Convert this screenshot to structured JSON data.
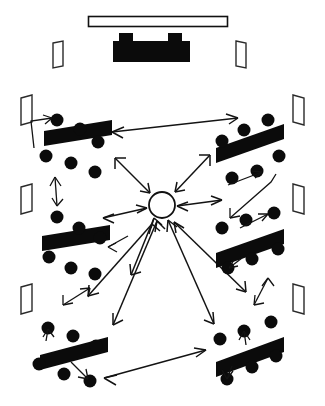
{
  "diagram": {
    "type": "floor-plan-interaction-diagram",
    "canvas": {
      "width": 325,
      "height": 406,
      "background": "#ffffff"
    },
    "ink_color": "#0b0b0b",
    "paper_color": "#ffffff"
  },
  "front": {
    "whiteboard": {
      "label": "whiteboard",
      "x": 88,
      "y": 16,
      "width": 140,
      "height": 11,
      "style": "outlined-rectangle"
    },
    "teacher_desk": {
      "label": "teacher desk",
      "x": 114,
      "y": 40,
      "width": 76,
      "height": 22,
      "style": "solid-black-with-two-tabs",
      "tabs": [
        {
          "x": 120,
          "y": 33,
          "width": 14,
          "height": 8
        },
        {
          "x": 168,
          "y": 33,
          "width": 14,
          "height": 8
        }
      ]
    }
  },
  "apertures": [
    {
      "name": "door-top-left",
      "x": 52,
      "y": 42,
      "width": 11,
      "height": 25,
      "skew": -2
    },
    {
      "name": "door-top-right",
      "x": 236,
      "y": 42,
      "width": 11,
      "height": 25,
      "skew": 2
    },
    {
      "name": "window-left-1",
      "x": 20,
      "y": 96,
      "width": 12,
      "height": 28,
      "skew": -3
    },
    {
      "name": "window-left-2",
      "x": 20,
      "y": 185,
      "width": 12,
      "height": 28,
      "skew": -3
    },
    {
      "name": "window-left-3",
      "x": 20,
      "y": 285,
      "width": 12,
      "height": 28,
      "skew": -3
    },
    {
      "name": "window-right-1",
      "x": 293,
      "y": 96,
      "width": 12,
      "height": 28,
      "skew": 3
    },
    {
      "name": "window-right-2",
      "x": 293,
      "y": 185,
      "width": 12,
      "height": 28,
      "skew": 3
    },
    {
      "name": "window-right-3",
      "x": 293,
      "y": 285,
      "width": 12,
      "height": 28,
      "skew": 3
    }
  ],
  "hub": {
    "name": "central-facilitator-node",
    "label": "facilitator",
    "cx": 162,
    "cy": 205,
    "r": 13,
    "style": "white-circle-black-outline"
  },
  "groups": [
    {
      "id": "group-top-left",
      "label": "Group 1",
      "desk": {
        "x1": 44,
        "y1": 134,
        "x2": 112,
        "y2": 124,
        "thickness": 15,
        "tilt": -8
      },
      "seat_count": 6,
      "seats": [
        {
          "x": 57,
          "y": 122,
          "r": 6
        },
        {
          "x": 80,
          "y": 131,
          "r": 6
        },
        {
          "x": 98,
          "y": 142,
          "r": 6
        },
        {
          "x": 47,
          "y": 155,
          "r": 6
        },
        {
          "x": 71,
          "y": 161,
          "r": 6
        },
        {
          "x": 95,
          "y": 170,
          "r": 6
        }
      ]
    },
    {
      "id": "group-top-right",
      "label": "Group 2",
      "desk": {
        "x1": 216,
        "y1": 150,
        "x2": 283,
        "y2": 127,
        "thickness": 15,
        "tilt": 9
      },
      "seat_count": 6,
      "seats": [
        {
          "x": 266,
          "y": 122,
          "r": 6
        },
        {
          "x": 243,
          "y": 132,
          "r": 6
        },
        {
          "x": 221,
          "y": 142,
          "r": 6
        },
        {
          "x": 278,
          "y": 155,
          "r": 6
        },
        {
          "x": 255,
          "y": 170,
          "r": 6
        },
        {
          "x": 231,
          "y": 176,
          "r": 6
        }
      ]
    },
    {
      "id": "group-mid-left",
      "label": "Group 3",
      "desk": {
        "x1": 42,
        "y1": 240,
        "x2": 110,
        "y2": 228,
        "thickness": 15,
        "tilt": -8
      },
      "seat_count": 6,
      "seats": [
        {
          "x": 57,
          "y": 216,
          "r": 6
        },
        {
          "x": 78,
          "y": 227,
          "r": 6
        },
        {
          "x": 99,
          "y": 236,
          "r": 6
        },
        {
          "x": 50,
          "y": 256,
          "r": 6
        },
        {
          "x": 71,
          "y": 266,
          "r": 6
        },
        {
          "x": 94,
          "y": 272,
          "r": 6
        }
      ]
    },
    {
      "id": "group-mid-right",
      "label": "Group 4",
      "desk": {
        "x1": 215,
        "y1": 255,
        "x2": 283,
        "y2": 233,
        "thickness": 15,
        "tilt": 9
      },
      "seat_count": 6,
      "seats": [
        {
          "x": 272,
          "y": 213,
          "r": 6
        },
        {
          "x": 244,
          "y": 220,
          "r": 6
        },
        {
          "x": 222,
          "y": 228,
          "r": 6
        },
        {
          "x": 277,
          "y": 248,
          "r": 6
        },
        {
          "x": 252,
          "y": 258,
          "r": 6
        },
        {
          "x": 228,
          "y": 266,
          "r": 6
        }
      ]
    },
    {
      "id": "group-bottom-left",
      "label": "Group 5",
      "desk": {
        "x1": 40,
        "y1": 358,
        "x2": 108,
        "y2": 340,
        "thickness": 15,
        "tilt": -9
      },
      "seat_count": 6,
      "seats": [
        {
          "x": 48,
          "y": 327,
          "r": 6
        },
        {
          "x": 73,
          "y": 335,
          "r": 6
        },
        {
          "x": 96,
          "y": 345,
          "r": 6
        },
        {
          "x": 39,
          "y": 362,
          "r": 6
        },
        {
          "x": 64,
          "y": 372,
          "r": 6
        },
        {
          "x": 89,
          "y": 379,
          "r": 6
        }
      ]
    },
    {
      "id": "group-bottom-right",
      "label": "Group 6",
      "desk": {
        "x1": 215,
        "y1": 365,
        "x2": 283,
        "y2": 340,
        "thickness": 15,
        "tilt": 10
      },
      "seat_count": 6,
      "seats": [
        {
          "x": 270,
          "y": 322,
          "r": 6
        },
        {
          "x": 244,
          "y": 330,
          "r": 6
        },
        {
          "x": 220,
          "y": 338,
          "r": 6
        },
        {
          "x": 275,
          "y": 355,
          "r": 6
        },
        {
          "x": 251,
          "y": 366,
          "r": 6
        },
        {
          "x": 226,
          "y": 377,
          "r": 6
        }
      ]
    }
  ],
  "flows": {
    "hub_links": [
      {
        "name": "hub-to-group-top-left",
        "from": "hub",
        "to": "group-top-left",
        "heads": "both"
      },
      {
        "name": "hub-to-group-top-right",
        "from": "hub",
        "to": "group-top-right",
        "heads": "both"
      },
      {
        "name": "hub-to-group-mid-left",
        "from": "hub",
        "to": "group-mid-left",
        "heads": "both"
      },
      {
        "name": "hub-to-group-mid-right",
        "from": "hub",
        "to": "group-mid-right",
        "heads": "both"
      },
      {
        "name": "hub-to-group-bottom-left",
        "from": "hub",
        "to": "group-bottom-left",
        "heads": "both"
      },
      {
        "name": "hub-to-group-bottom-right",
        "from": "hub",
        "to": "group-bottom-right",
        "heads": "both"
      }
    ],
    "peer_links": [
      {
        "name": "link-top-left-to-top-right",
        "from": "group-top-left",
        "to": "group-top-right",
        "heads": "both"
      },
      {
        "name": "link-bottom-left-to-bottom-right",
        "from": "group-bottom-left",
        "to": "group-bottom-right",
        "heads": "both"
      }
    ],
    "local_links": [
      {
        "name": "local-loop-top-left",
        "group": "group-top-left"
      },
      {
        "name": "local-loop-top-right",
        "group": "group-top-right"
      },
      {
        "name": "local-loop-mid-left",
        "group": "group-mid-left"
      },
      {
        "name": "local-loop-mid-right",
        "group": "group-mid-right"
      },
      {
        "name": "local-loop-bottom-left",
        "group": "group-bottom-left"
      },
      {
        "name": "local-loop-bottom-right",
        "group": "group-bottom-right"
      }
    ]
  }
}
